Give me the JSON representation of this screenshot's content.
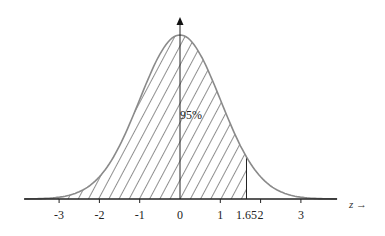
{
  "chart_data": {
    "type": "area",
    "title": "",
    "xlabel": "z →",
    "ylabel": "",
    "x_ticks": [
      -3,
      -2,
      -1,
      0,
      1,
      1.65,
      2,
      3
    ],
    "x_tick_labels": [
      "-3",
      "-2",
      "-1",
      "0",
      "1",
      "1.65",
      "2",
      "3"
    ],
    "xlim": [
      -3.85,
      3.9
    ],
    "shaded_region": {
      "from": -3.85,
      "to": 1.65,
      "pattern": "diagonal-hatch"
    },
    "annotations": [
      {
        "text": "95%",
        "x": 0,
        "y": "mid"
      }
    ],
    "curve": "standard normal pdf",
    "grid": false,
    "legend": null
  },
  "labels": {
    "percent": "95%",
    "axis": "z →"
  },
  "style": {
    "curve_color": "#8a8a8a",
    "hatch_color": "#222222",
    "axis_color": "#222222"
  }
}
